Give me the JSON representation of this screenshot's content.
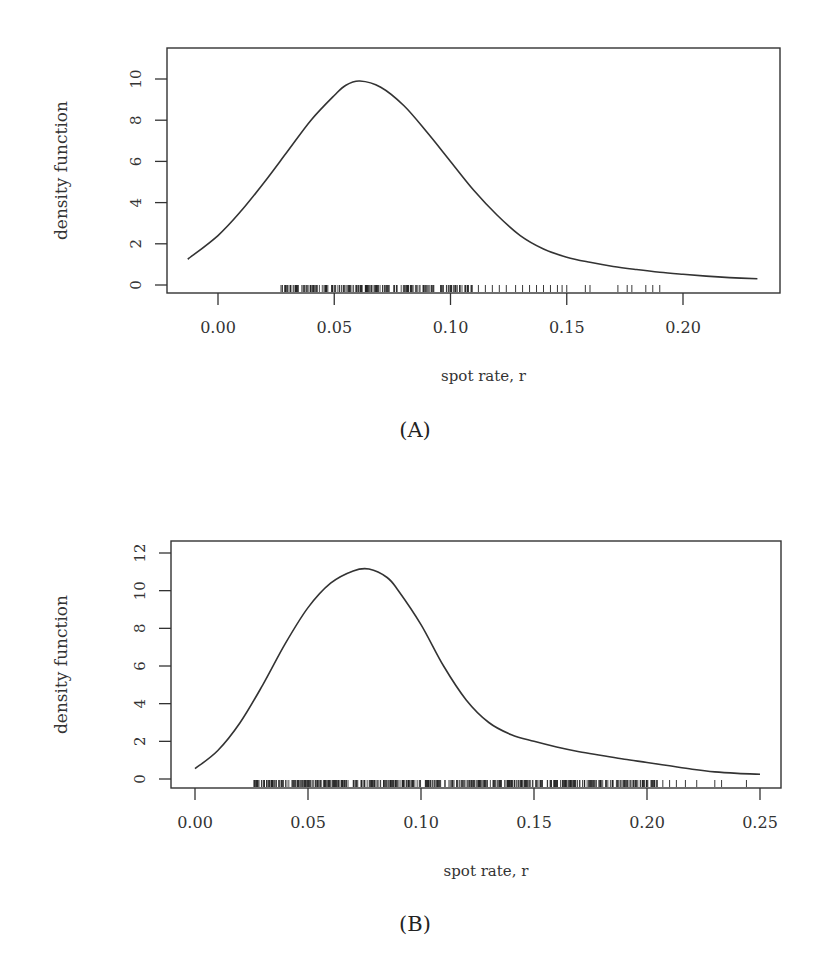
{
  "figure": {
    "panels": [
      {
        "caption": "(A)"
      },
      {
        "caption": "(B)"
      }
    ]
  },
  "chart_data": [
    {
      "type": "line",
      "title": "",
      "panel_label": "(A)",
      "xlabel": "spot rate, r",
      "ylabel": "density function",
      "xlim": [
        -0.022,
        0.242
      ],
      "ylim": [
        -0.4,
        10.8
      ],
      "xticks": [
        0.0,
        0.05,
        0.1,
        0.15,
        0.2
      ],
      "xtick_labels": [
        "0.00",
        "0.05",
        "0.10",
        "0.15",
        "0.20"
      ],
      "yticks": [
        0,
        2,
        4,
        6,
        8,
        10
      ],
      "ytick_labels": [
        "0",
        "2",
        "4",
        "6",
        "8",
        "10"
      ],
      "grid": false,
      "legend": null,
      "line_color": "#333333",
      "series": [
        {
          "name": "kernel density estimate",
          "x": [
            -0.013,
            0.0,
            0.01,
            0.02,
            0.03,
            0.04,
            0.05,
            0.055,
            0.061,
            0.07,
            0.08,
            0.09,
            0.1,
            0.11,
            0.12,
            0.13,
            0.14,
            0.15,
            0.16,
            0.17,
            0.18,
            0.19,
            0.2,
            0.21,
            0.22,
            0.232
          ],
          "y": [
            1.25,
            2.4,
            3.6,
            5.0,
            6.5,
            8.0,
            9.2,
            9.7,
            9.9,
            9.6,
            8.7,
            7.4,
            6.0,
            4.6,
            3.4,
            2.4,
            1.75,
            1.35,
            1.1,
            0.9,
            0.75,
            0.62,
            0.52,
            0.43,
            0.36,
            0.3
          ]
        }
      ],
      "rug": {
        "description": "rug marks of observed spot rates along x-axis",
        "dense_range": [
          0.027,
          0.11
        ],
        "sparse_points": [
          0.112,
          0.115,
          0.118,
          0.121,
          0.124,
          0.128,
          0.131,
          0.134,
          0.137,
          0.14,
          0.143,
          0.146,
          0.148,
          0.15,
          0.158,
          0.16,
          0.172,
          0.176,
          0.178,
          0.184,
          0.187,
          0.19
        ]
      }
    },
    {
      "type": "line",
      "title": "",
      "panel_label": "(B)",
      "xlabel": "spot rate, r",
      "ylabel": "density function",
      "xlim": [
        -0.011,
        0.261
      ],
      "ylim": [
        -0.5,
        13.0
      ],
      "xticks": [
        0.0,
        0.05,
        0.1,
        0.15,
        0.2,
        0.25
      ],
      "xtick_labels": [
        "0.00",
        "0.05",
        "0.10",
        "0.15",
        "0.20",
        "0.25"
      ],
      "yticks": [
        0,
        2,
        4,
        6,
        8,
        10,
        12
      ],
      "ytick_labels": [
        "0",
        "2",
        "4",
        "6",
        "8",
        "10",
        "12"
      ],
      "grid": false,
      "legend": null,
      "line_color": "#333333",
      "series": [
        {
          "name": "kernel density estimate",
          "x": [
            0.0,
            0.01,
            0.02,
            0.03,
            0.04,
            0.05,
            0.06,
            0.07,
            0.077,
            0.085,
            0.09,
            0.1,
            0.11,
            0.12,
            0.13,
            0.14,
            0.15,
            0.16,
            0.17,
            0.18,
            0.19,
            0.2,
            0.21,
            0.22,
            0.23,
            0.24,
            0.25
          ],
          "y": [
            0.55,
            1.5,
            3.0,
            5.0,
            7.2,
            9.1,
            10.4,
            11.05,
            11.15,
            10.7,
            10.0,
            8.2,
            6.0,
            4.2,
            3.0,
            2.35,
            2.0,
            1.7,
            1.45,
            1.25,
            1.05,
            0.88,
            0.7,
            0.52,
            0.38,
            0.3,
            0.25
          ]
        }
      ],
      "rug": {
        "description": "rug marks of observed spot rates along x-axis",
        "dense_range": [
          0.026,
          0.205
        ],
        "sparse_points": [
          0.207,
          0.21,
          0.213,
          0.217,
          0.222,
          0.23,
          0.233,
          0.244
        ]
      }
    }
  ]
}
